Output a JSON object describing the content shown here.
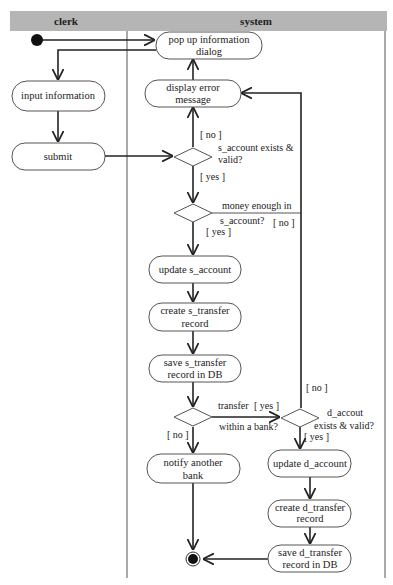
{
  "diagram": {
    "type": "UML activity diagram with swimlanes",
    "header_color": "#b5b5b5",
    "lanes": [
      {
        "id": "clerk",
        "label": "clerk"
      },
      {
        "id": "system",
        "label": "system"
      }
    ],
    "nodes": {
      "start": {
        "kind": "initial"
      },
      "pop_up": {
        "lines": [
          "pop up information",
          "dialog"
        ]
      },
      "display_error": {
        "lines": [
          "display error",
          "message"
        ]
      },
      "input_info": {
        "lines": [
          "input information"
        ]
      },
      "submit": {
        "lines": [
          "submit"
        ]
      },
      "update_s_account": {
        "lines": [
          "update s_account"
        ]
      },
      "create_s_transfer": {
        "lines": [
          "create s_transfer",
          "record"
        ]
      },
      "save_s_transfer": {
        "lines": [
          "save s_transfer",
          "record in DB"
        ]
      },
      "notify_bank": {
        "lines": [
          "notify another",
          "bank"
        ]
      },
      "update_d_account": {
        "lines": [
          "update d_account"
        ]
      },
      "create_d_transfer": {
        "lines": [
          "create d_transfer",
          "record"
        ]
      },
      "save_d_transfer": {
        "lines": [
          "save d_transfer",
          "record in DB"
        ]
      },
      "end": {
        "kind": "final"
      }
    },
    "decisions": {
      "s_account_valid": {
        "lines": [
          "s_account exists &",
          "valid?"
        ],
        "yes": "[ yes ]",
        "no": "[ no ]"
      },
      "money_enough": {
        "lines": [
          "money enough in",
          "s_account?"
        ],
        "yes": "[ yes ]",
        "no": "[ no ]"
      },
      "within_bank": {
        "lines": [
          "transfer",
          "within a bank?"
        ],
        "yes": "[ yes ]",
        "no": "[ no ]"
      },
      "d_account_valid": {
        "lines": [
          "d_accout",
          "exists & valid?"
        ],
        "yes": "[ yes ]",
        "no": "[ no ]"
      }
    }
  }
}
